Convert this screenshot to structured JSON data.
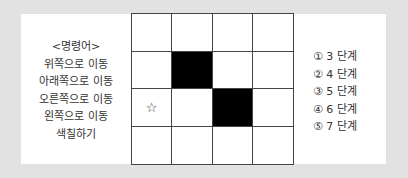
{
  "commands": {
    "title": "<명령어>",
    "items": [
      "위쪽으로 이동",
      "아래쪽으로 이동",
      "오른쪽으로 이동",
      "왼쪽으로 이동",
      "색칠하기"
    ]
  },
  "grid": {
    "rows": 4,
    "cols": 4,
    "cells": [
      [
        "",
        "",
        "",
        ""
      ],
      [
        "",
        "filled",
        "",
        ""
      ],
      [
        "star",
        "",
        "filled",
        ""
      ],
      [
        "",
        "",
        "",
        ""
      ]
    ],
    "star_glyph": "☆"
  },
  "options": [
    "① 3 단계",
    "② 4 단계",
    "③ 5 단계",
    "④ 6 단계",
    "⑤ 7 단계"
  ]
}
